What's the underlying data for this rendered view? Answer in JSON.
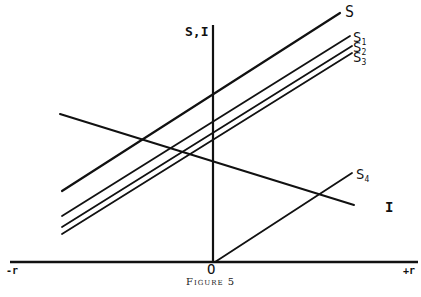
{
  "figure": {
    "caption": "Figure 5",
    "y_axis_label": "S,I",
    "x_axis_left_label": "-r",
    "x_axis_right_label": "+r",
    "origin_label": "O",
    "colors": {
      "ink": "#111111",
      "background": "#ffffff"
    }
  },
  "lines": [
    {
      "name": "S",
      "label": "S",
      "sub": "",
      "x1": 62,
      "y1": 191,
      "x2": 340,
      "y2": 13,
      "width": 2.2
    },
    {
      "name": "S1",
      "label": "S",
      "sub": "1",
      "x1": 62,
      "y1": 216,
      "x2": 350,
      "y2": 36,
      "width": 1.8
    },
    {
      "name": "S2",
      "label": "S",
      "sub": "2",
      "x1": 62,
      "y1": 227,
      "x2": 352,
      "y2": 46,
      "width": 1.8
    },
    {
      "name": "S3",
      "label": "S",
      "sub": "3",
      "x1": 62,
      "y1": 234,
      "x2": 352,
      "y2": 53,
      "width": 1.8
    },
    {
      "name": "S4",
      "label": "S",
      "sub": "4",
      "x1": 215,
      "y1": 262,
      "x2": 352,
      "y2": 173,
      "width": 1.8
    },
    {
      "name": "I",
      "label": "I",
      "sub": "",
      "x1": 60,
      "y1": 114,
      "x2": 354,
      "y2": 205,
      "width": 2.0
    }
  ],
  "axes": {
    "x_axis": {
      "x1": 10,
      "y1": 262,
      "x2": 418,
      "y2": 262
    },
    "y_axis": {
      "x1": 213,
      "y1": 25,
      "x2": 213,
      "y2": 262
    }
  },
  "chart_data": {
    "type": "line",
    "title": "Figure 5",
    "xlabel": "r (from -r to +r)",
    "ylabel": "S,I",
    "series": [
      {
        "name": "S",
        "description": "upward-sloping saving schedule, highest"
      },
      {
        "name": "S1",
        "description": "upward-sloping saving schedule, shifted down"
      },
      {
        "name": "S2",
        "description": "upward-sloping saving schedule, shifted further down"
      },
      {
        "name": "S3",
        "description": "upward-sloping saving schedule, lowest of parallel group"
      },
      {
        "name": "S4",
        "description": "saving schedule starting at origin O, rising to the right"
      },
      {
        "name": "I",
        "description": "downward-sloping investment schedule"
      }
    ],
    "annotations": [
      "S",
      "S1",
      "S2",
      "S3",
      "S4",
      "I",
      "O",
      "-r",
      "+r",
      "S,I"
    ],
    "grid": false
  }
}
